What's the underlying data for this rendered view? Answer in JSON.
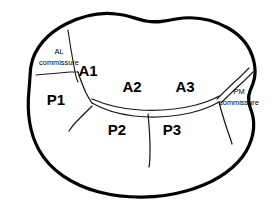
{
  "diagram": {
    "type": "anatomical-schematic",
    "background_color": "#ffffff",
    "outline_color": "#000000",
    "line_color": "#1a1a1a",
    "canvas": {
      "width": 278,
      "height": 204
    }
  },
  "anterior_segments": [
    {
      "id": "A1",
      "label": "A1",
      "x": 88,
      "y": 72
    },
    {
      "id": "A2",
      "label": "A2",
      "x": 132,
      "y": 88
    },
    {
      "id": "A3",
      "label": "A3",
      "x": 185,
      "y": 88
    }
  ],
  "posterior_segments": [
    {
      "id": "P1",
      "label": "P1",
      "x": 56,
      "y": 101
    },
    {
      "id": "P2",
      "label": "P2",
      "x": 117,
      "y": 131
    },
    {
      "id": "P3",
      "label": "P3",
      "x": 172,
      "y": 131
    }
  ],
  "commissures": [
    {
      "id": "AL",
      "line1": "AL",
      "line2": "commissure",
      "line1_x": 59,
      "line1_y": 52,
      "line2_x": 59,
      "line2_y": 63
    },
    {
      "id": "PM",
      "line1": "PM",
      "line2": "commissure",
      "line1_x": 239,
      "line1_y": 92,
      "line2_x": 239,
      "line2_y": 103
    }
  ]
}
